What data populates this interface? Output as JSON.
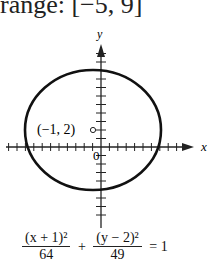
{
  "header": {
    "range_text": "range: [−5, 9]"
  },
  "chart_data": {
    "type": "line",
    "title": "",
    "xlabel": "x",
    "ylabel": "y",
    "grid": false,
    "curve": "ellipse",
    "center": {
      "x": -1,
      "y": 2,
      "label": "(−1, 2)"
    },
    "semi_axis_x": 8,
    "semi_axis_y": 7,
    "x_extent": [
      -9,
      7
    ],
    "y_extent": [
      -5,
      9
    ],
    "origin_label": "0",
    "axis_range_x": [
      -11,
      9
    ],
    "axis_range_y": [
      -8,
      11
    ],
    "tick_spacing": 1
  },
  "equation": {
    "num1": "(x + 1)²",
    "den1": "64",
    "plus": "+",
    "num2": "(y − 2)²",
    "den2": "49",
    "equals": "= 1"
  },
  "colors": {
    "curve": "#111111",
    "axes": "#222222"
  }
}
